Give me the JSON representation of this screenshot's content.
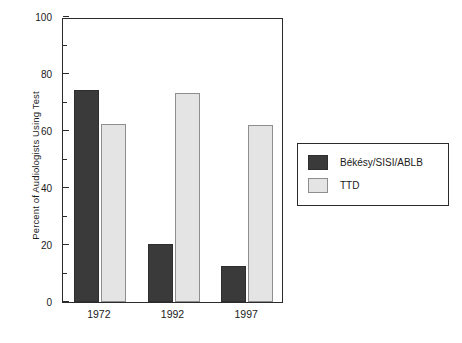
{
  "chart_data": {
    "type": "bar",
    "title": "",
    "xlabel": "",
    "ylabel": "Percent of Audiologists Using Test",
    "categories": [
      "1972",
      "1992",
      "1997"
    ],
    "series": [
      {
        "name": "Békésy/SISI/ABLB",
        "color": "#3a3a3a",
        "values": [
          74.5,
          20.5,
          12.5
        ]
      },
      {
        "name": "TTD",
        "color": "#e4e4e4",
        "values": [
          62.5,
          73.5,
          62.0
        ]
      }
    ],
    "ylim": [
      0,
      100
    ],
    "ytick_major": [
      0,
      20,
      40,
      60,
      80,
      100
    ],
    "ytick_minor": [
      10,
      30,
      50,
      70,
      90
    ],
    "ytick_labels": [
      "0",
      "20",
      "40",
      "60",
      "80",
      "100"
    ],
    "grid": false,
    "legend_position": "right"
  },
  "axis": {
    "y_title": "Percent of Audiologists Using Test"
  },
  "legend": {
    "entries": [
      {
        "label": "Békésy/SISI/ABLB"
      },
      {
        "label": "TTD"
      }
    ]
  }
}
